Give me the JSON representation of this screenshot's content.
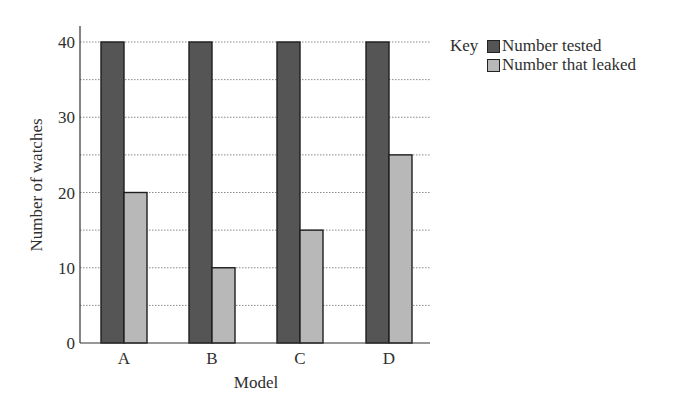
{
  "chart_data": {
    "type": "bar",
    "title": "",
    "xlabel": "Model",
    "ylabel": "Number of watches",
    "categories": [
      "A",
      "B",
      "C",
      "D"
    ],
    "series": [
      {
        "name": "Number tested",
        "color": "#555555",
        "values": [
          40,
          40,
          40,
          40
        ]
      },
      {
        "name": "Number that leaked",
        "color": "#b8b8b8",
        "values": [
          20,
          10,
          15,
          25
        ]
      }
    ],
    "ylim": [
      0,
      40
    ],
    "yticks": [
      0,
      10,
      20,
      30,
      40
    ],
    "minor_gridlines": [
      5,
      15,
      25,
      35
    ],
    "grid": true,
    "grid_style": "dotted",
    "legend_position": "right",
    "legend_title": "Key"
  },
  "legend": {
    "title": "Key",
    "items": [
      {
        "label": "Number tested",
        "color": "#555555"
      },
      {
        "label": "Number that leaked",
        "color": "#b8b8b8"
      }
    ]
  }
}
